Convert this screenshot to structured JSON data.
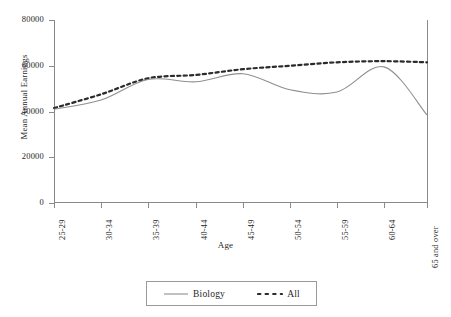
{
  "chart_data": {
    "type": "line",
    "title": "",
    "xlabel": "Age",
    "ylabel": "Mean Annual Earnings",
    "categories": [
      "25-29",
      "30-34",
      "35-39",
      "40-44",
      "45-49",
      "50-54",
      "55-59",
      "60-64",
      "65 and over"
    ],
    "series": [
      {
        "name": "Biology",
        "style": "solid",
        "color": "#8f8f8f",
        "values": [
          41000,
          45000,
          54000,
          53000,
          56500,
          49500,
          48500,
          59500,
          38500
        ]
      },
      {
        "name": "All",
        "style": "dotted",
        "color": "#2b2b2b",
        "values": [
          41500,
          47500,
          54500,
          56000,
          58500,
          60000,
          61500,
          62000,
          61500
        ]
      }
    ],
    "ylim": [
      0,
      80000
    ],
    "yticks": [
      0,
      20000,
      40000,
      60000,
      80000
    ],
    "ytick_labels": [
      "0",
      "20000",
      "40000",
      "60000",
      "80000"
    ],
    "grid": false,
    "legend_position": "bottom",
    "smoothing": "spline"
  },
  "legend": {
    "entries": [
      {
        "label": "Biology",
        "swatch": "solid-line-swatch"
      },
      {
        "label": "All",
        "swatch": "dotted-line-swatch"
      }
    ]
  }
}
